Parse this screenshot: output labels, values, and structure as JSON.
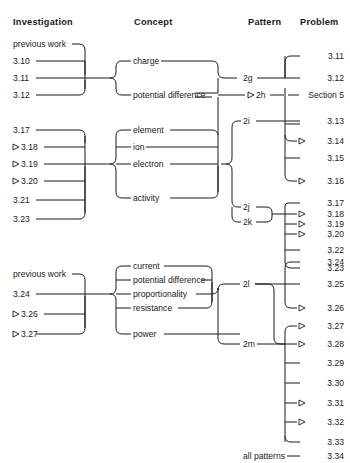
{
  "headers": [
    {
      "label": "Investigation"
    },
    {
      "label": "Concept"
    },
    {
      "label": "Pattern"
    },
    {
      "label": "Problem"
    }
  ],
  "groups": [
    {
      "id": "group-1",
      "investigations": [
        {
          "label": "previous work",
          "marker": false
        },
        {
          "label": "3.10",
          "marker": false
        },
        {
          "label": "3.11",
          "marker": false
        },
        {
          "label": "3.12",
          "marker": false
        }
      ],
      "concepts": [
        {
          "label": "charge"
        },
        {
          "label": "potential difference"
        }
      ],
      "patterns": [
        {
          "label": "2g",
          "marker": false
        },
        {
          "label": "2h",
          "marker": true
        }
      ],
      "problems": [
        {
          "label": "3.11",
          "marker": false
        },
        {
          "label": "3.12",
          "marker": false
        },
        {
          "label": "Section 5",
          "marker": false
        }
      ]
    },
    {
      "id": "group-2",
      "investigations": [
        {
          "label": "3.17",
          "marker": false
        },
        {
          "label": "3.18",
          "marker": true
        },
        {
          "label": "3.19",
          "marker": true
        },
        {
          "label": "3.20",
          "marker": true
        },
        {
          "label": "3.21",
          "marker": false
        },
        {
          "label": "3.23",
          "marker": false
        }
      ],
      "concepts": [
        {
          "label": "element"
        },
        {
          "label": "ion"
        },
        {
          "label": "electron"
        },
        {
          "label": "activity"
        }
      ],
      "patterns": [
        {
          "label": "2i",
          "marker": false
        },
        {
          "label": "2j",
          "marker": false
        },
        {
          "label": "2k",
          "marker": false
        }
      ],
      "problems": [
        {
          "label": "3.13",
          "marker": false
        },
        {
          "label": "3.14",
          "marker": true
        },
        {
          "label": "3.15",
          "marker": false
        },
        {
          "label": "3.16",
          "marker": true
        },
        {
          "label": "3.17",
          "marker": false
        },
        {
          "label": "3.18",
          "marker": true
        },
        {
          "label": "3.19",
          "marker": true
        },
        {
          "label": "3.20",
          "marker": true
        },
        {
          "label": "3.22",
          "marker": false
        },
        {
          "label": "3.23",
          "marker": false
        }
      ]
    },
    {
      "id": "group-3",
      "investigations": [
        {
          "label": "previous work",
          "marker": false
        },
        {
          "label": "3.24",
          "marker": false
        },
        {
          "label": "3.26",
          "marker": true
        },
        {
          "label": "3.27",
          "marker": true
        }
      ],
      "concepts": [
        {
          "label": "current"
        },
        {
          "label": "potential difference"
        },
        {
          "label": "proportionality"
        },
        {
          "label": "resistance"
        },
        {
          "label": "power"
        }
      ],
      "patterns": [
        {
          "label": "2l",
          "marker": false
        },
        {
          "label": "2m",
          "marker": false
        }
      ],
      "problems": [
        {
          "label": "3.24",
          "marker": false
        },
        {
          "label": "3.25",
          "marker": false
        },
        {
          "label": "3.26",
          "marker": true
        },
        {
          "label": "3.27",
          "marker": true
        },
        {
          "label": "3.28",
          "marker": true
        },
        {
          "label": "3.29",
          "marker": false
        },
        {
          "label": "3.30",
          "marker": false
        },
        {
          "label": "3.31",
          "marker": true
        },
        {
          "label": "3.32",
          "marker": true
        },
        {
          "label": "3.33",
          "marker": false
        }
      ]
    },
    {
      "id": "group-4",
      "investigations": [],
      "concepts": [],
      "patterns": [
        {
          "label": "all patterns",
          "marker": false
        }
      ],
      "problems": [
        {
          "label": "3.34",
          "marker": false
        }
      ]
    }
  ],
  "labels": {
    "h_investigation": "Investigation",
    "h_concept": "Concept",
    "h_pattern": "Pattern",
    "h_problem": "Problem",
    "i_prev_1": "previous work",
    "i_310": "3.10",
    "i_311": "3.11",
    "i_312": "3.12",
    "i_317": "3.17",
    "i_318": "3.18",
    "i_319": "3.19",
    "i_320": "3.20",
    "i_321": "3.21",
    "i_323": "3.23",
    "i_prev_2": "previous work",
    "i_324": "3.24",
    "i_326": "3.26",
    "i_327": "3.27",
    "c_charge": "charge",
    "c_pd1": "potential difference",
    "c_element": "element",
    "c_ion": "ion",
    "c_electron": "electron",
    "c_activity": "activity",
    "c_current": "current",
    "c_pd2": "potential difference",
    "c_proportionality": "proportionality",
    "c_resistance": "resistance",
    "c_power": "power",
    "p_2g": "2g",
    "p_2h": "2h",
    "p_2i": "2i",
    "p_2j": "2j",
    "p_2k": "2k",
    "p_2l": "2l",
    "p_2m": "2m",
    "p_all": "all patterns",
    "r_311": "3.11",
    "r_312": "3.12",
    "r_sec5": "Section 5",
    "r_313": "3.13",
    "r_314": "3.14",
    "r_315": "3.15",
    "r_316": "3.16",
    "r_317": "3.17",
    "r_318": "3.18",
    "r_319": "3.19",
    "r_320": "3.20",
    "r_322": "3.22",
    "r_323": "3.23",
    "r_324": "3.24",
    "r_325": "3.25",
    "r_326": "3.26",
    "r_327": "3.27",
    "r_328": "3.28",
    "r_329": "3.29",
    "r_330": "3.30",
    "r_331": "3.31",
    "r_332": "3.32",
    "r_333": "3.33",
    "r_334": "3.34"
  },
  "colors": {
    "ink": "#1a1a1a",
    "background": "#ffffff"
  }
}
